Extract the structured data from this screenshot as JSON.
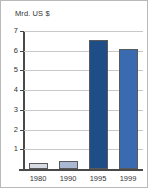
{
  "chart_data": {
    "type": "bar",
    "title": "Mrd. US $",
    "xlabel": "",
    "ylabel": "Mrd. US $",
    "categories": [
      "1980",
      "1990",
      "1995",
      "1999"
    ],
    "values": [
      0.3,
      0.4,
      6.55,
      6.1
    ],
    "ylim": [
      0,
      7
    ],
    "yticks": [
      1,
      2,
      3,
      4,
      5,
      6,
      7
    ],
    "ytick_labels": [
      "1",
      "2",
      "3",
      "4",
      "5",
      "6",
      "7"
    ],
    "grid": true,
    "legend": false,
    "bar_colors": [
      "#d6dbe4",
      "#aab8d2",
      "#1f4e86",
      "#3a6aaf"
    ],
    "bar_border_color": "#5a5a5a",
    "axis_color": "#4a4a4a",
    "grid_color": "#c8c8c8",
    "background": "#ffffff",
    "text_color": "#333333"
  }
}
